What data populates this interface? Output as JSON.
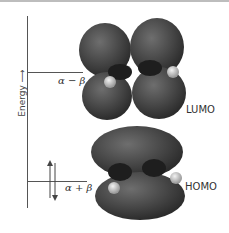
{
  "axis": {
    "label": "Energy",
    "arrow": "arrow-up"
  },
  "levels": {
    "lumo": {
      "energy_label": "α − β",
      "orbital_label": "LUMO"
    },
    "homo": {
      "energy_label": "α + β",
      "orbital_label": "HOMO",
      "electrons": "spin-paired-arrows"
    }
  },
  "colors": {
    "lobe": "#3a3a3a",
    "lobe_highlight": "#7a7a7a",
    "atom_h": "#d8d8d8",
    "axis": "#555555"
  }
}
